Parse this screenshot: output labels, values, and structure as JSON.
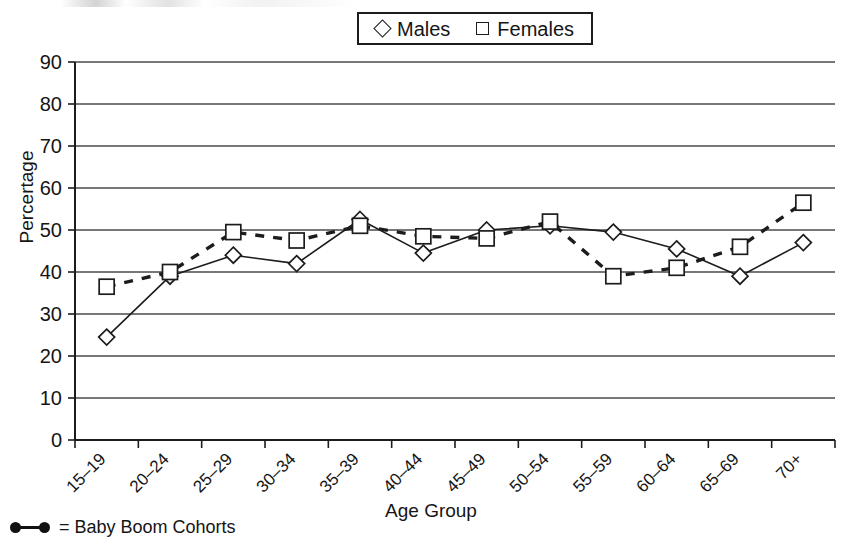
{
  "chart_data": {
    "type": "line",
    "title": "",
    "xlabel": "Age Group",
    "ylabel": "Percertage",
    "ylim": [
      0,
      90
    ],
    "ytick_step": 10,
    "yticks": [
      0,
      10,
      20,
      30,
      40,
      50,
      60,
      70,
      80,
      90
    ],
    "grid": true,
    "grid_axis": "y",
    "legend_position": "top-center",
    "categories": [
      "15–19",
      "20–24",
      "25–29",
      "30–34",
      "35–39",
      "40–44",
      "45–49",
      "50–54",
      "55–59",
      "60–64",
      "65–69",
      "70+"
    ],
    "series": [
      {
        "name": "Males",
        "marker": "diamond",
        "linestyle": "solid",
        "values": [
          24.5,
          39.0,
          44.0,
          42.0,
          52.5,
          44.5,
          50.0,
          51.0,
          49.5,
          45.5,
          39.0,
          47.0
        ]
      },
      {
        "name": "Females",
        "marker": "square",
        "linestyle": "dashed",
        "values": [
          36.5,
          40.0,
          49.5,
          47.5,
          51.0,
          48.5,
          48.0,
          52.0,
          39.0,
          41.0,
          46.0,
          56.5
        ]
      }
    ],
    "annotations": [
      {
        "text": "●—● = Baby Boom Cohorts",
        "position": "bottom-left"
      }
    ]
  },
  "legend": {
    "males_label": "Males",
    "females_label": "Females"
  },
  "axes": {
    "y_title": "Percertage",
    "x_title": "Age Group"
  },
  "footnote": {
    "text": "= Baby Boom Cohorts"
  },
  "colors": {
    "axis": "#1c1c1c",
    "grid": "#4a4a4a",
    "males": "#1c1c1c",
    "females": "#1c1c1c",
    "background": "#ffffff"
  }
}
